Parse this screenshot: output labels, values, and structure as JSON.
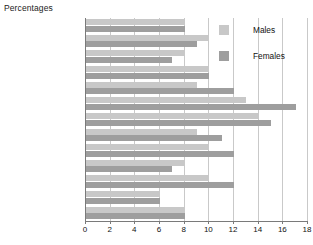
{
  "title": "Percentages",
  "legend": {
    "position": "top-right",
    "entries": [
      {
        "label": "Males",
        "color": "#c8c8c8",
        "swatch_name": "males-swatch"
      },
      {
        "label": "Females",
        "color": "#9e9e9e",
        "swatch_name": "females-swatch"
      }
    ]
  },
  "axis": {
    "x_ticks": [
      "0",
      "2",
      "4",
      "6",
      "8",
      "10",
      "12",
      "14",
      "16",
      "18"
    ],
    "x_min": 0,
    "x_max": 18,
    "x_step": 2
  },
  "chart_data": {
    "type": "bar",
    "orientation": "horizontal",
    "title": "Percentages",
    "xlabel": "",
    "ylabel": "",
    "xlim": [
      0,
      18
    ],
    "grid": true,
    "legend_position": "top-right",
    "categories": [
      "White British",
      "White Irish",
      "Other White",
      "Mixed",
      "Indian",
      "Pakistani",
      "Bangladeshi",
      "Other Asian",
      "Black Caribbean",
      "Black African",
      "Other Black",
      "Chinese",
      "Other ethnic group"
    ],
    "series": [
      {
        "name": "Males",
        "color": "#c8c8c8",
        "values": [
          8,
          10,
          8,
          10,
          9,
          13,
          14,
          9,
          10,
          8,
          10,
          6,
          8
        ]
      },
      {
        "name": "Females",
        "color": "#9e9e9e",
        "values": [
          8,
          9,
          7,
          10,
          12,
          17,
          15,
          11,
          12,
          7,
          12,
          6,
          8
        ]
      }
    ]
  }
}
